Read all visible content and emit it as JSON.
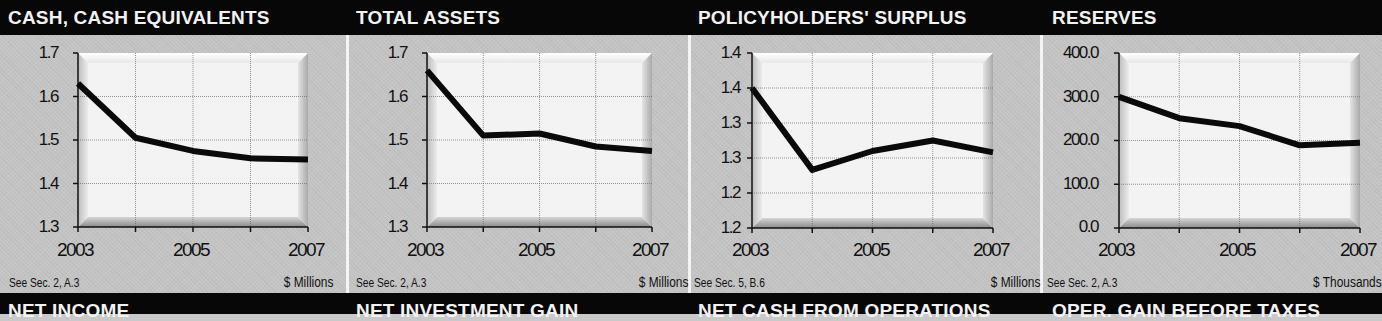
{
  "colors": {
    "band": "#070707",
    "panel": "#c4c4c4",
    "line": "#0a0a0a",
    "plot_bg": "#f3f3f3",
    "divider": "#f4f4f4"
  },
  "bottom_titles": [
    "NET INCOME",
    "NET INVESTMENT GAIN",
    "NET CASH FROM OPERATIONS",
    "OPER. GAIN BEFORE TAXES"
  ],
  "panels": [
    {
      "title": "CASH, CASH EQUIVALENTS",
      "yticks": [
        "1.7",
        "1.6",
        "1.5",
        "1.4",
        "1.3"
      ],
      "xticks": [
        "2003",
        "2005",
        "2007"
      ],
      "note": "See Sec. 2, A.3",
      "unit": "$ Millions"
    },
    {
      "title": "TOTAL ASSETS",
      "yticks": [
        "1.7",
        "1.6",
        "1.5",
        "1.4",
        "1.3"
      ],
      "xticks": [
        "2003",
        "2005",
        "2007"
      ],
      "note": "See Sec. 2, A.3",
      "unit": "$ Millions"
    },
    {
      "title": "POLICYHOLDERS' SURPLUS",
      "yticks": [
        "1.4",
        "1.4",
        "1.3",
        "1.3",
        "1.2",
        "1.2"
      ],
      "xticks": [
        "2003",
        "2005",
        "2007"
      ],
      "note": "See Sec. 5, B.6",
      "unit": "$ Millions"
    },
    {
      "title": "RESERVES",
      "yticks": [
        "400.0",
        "300.0",
        "200.0",
        "100.0",
        "0.0"
      ],
      "xticks": [
        "2003",
        "2005",
        "2007"
      ],
      "note": "See Sec. 2, A.3",
      "unit": "$ Thousands"
    }
  ],
  "chart_data": [
    {
      "type": "line",
      "title": "CASH, CASH EQUIVALENTS",
      "x": [
        2003,
        2004,
        2005,
        2006,
        2007
      ],
      "series": [
        {
          "name": "Cash, Cash Equivalents",
          "values": [
            1.63,
            1.505,
            1.475,
            1.458,
            1.455
          ]
        }
      ],
      "xlabel": "",
      "ylabel": "$ Millions",
      "ylim": [
        1.3,
        1.7
      ],
      "ytick_labels": [
        "1.7",
        "1.6",
        "1.5",
        "1.4",
        "1.3"
      ],
      "xtick_labels": [
        "2003",
        "2005",
        "2007"
      ],
      "grid": true,
      "footnote": "See Sec. 2, A.3"
    },
    {
      "type": "line",
      "title": "TOTAL ASSETS",
      "x": [
        2003,
        2004,
        2005,
        2006,
        2007
      ],
      "series": [
        {
          "name": "Total Assets",
          "values": [
            1.66,
            1.51,
            1.515,
            1.485,
            1.475
          ]
        }
      ],
      "xlabel": "",
      "ylabel": "$ Millions",
      "ylim": [
        1.3,
        1.7
      ],
      "ytick_labels": [
        "1.7",
        "1.6",
        "1.5",
        "1.4",
        "1.3"
      ],
      "xtick_labels": [
        "2003",
        "2005",
        "2007"
      ],
      "grid": true,
      "footnote": "See Sec. 2, A.3"
    },
    {
      "type": "line",
      "title": "POLICYHOLDERS' SURPLUS",
      "x": [
        2003,
        2004,
        2005,
        2006,
        2007
      ],
      "series": [
        {
          "name": "Policyholders' Surplus",
          "values": [
            1.35,
            1.233,
            1.26,
            1.275,
            1.258
          ]
        }
      ],
      "xlabel": "",
      "ylabel": "$ Millions",
      "ylim": [
        1.15,
        1.4
      ],
      "ytick_labels": [
        "1.4",
        "1.4",
        "1.3",
        "1.3",
        "1.2",
        "1.2"
      ],
      "xtick_labels": [
        "2003",
        "2005",
        "2007"
      ],
      "grid": true,
      "footnote": "See Sec. 5, B.6"
    },
    {
      "type": "line",
      "title": "RESERVES",
      "x": [
        2003,
        2004,
        2005,
        2006,
        2007
      ],
      "series": [
        {
          "name": "Reserves",
          "values": [
            300,
            251,
            233,
            189,
            195
          ]
        }
      ],
      "xlabel": "",
      "ylabel": "$ Thousands",
      "ylim": [
        0,
        400
      ],
      "ytick_labels": [
        "400.0",
        "300.0",
        "200.0",
        "100.0",
        "0.0"
      ],
      "xtick_labels": [
        "2003",
        "2005",
        "2007"
      ],
      "grid": true,
      "footnote": "See Sec. 2, A.3"
    }
  ]
}
